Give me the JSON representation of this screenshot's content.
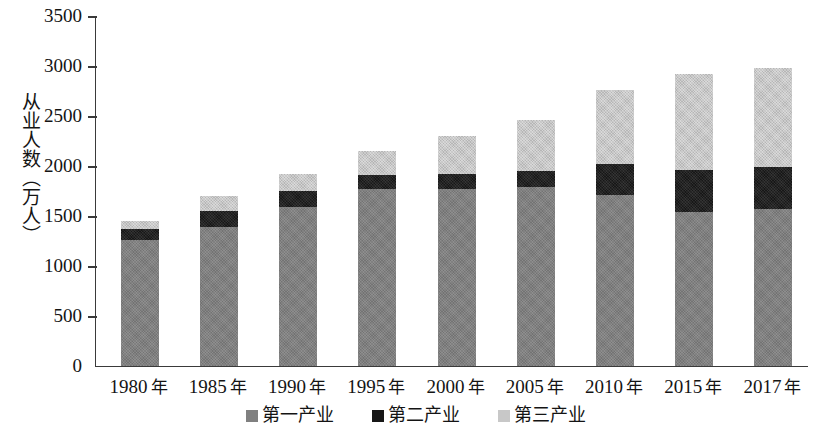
{
  "chart_data": {
    "type": "bar",
    "subtype": "stacked-bar",
    "title": "",
    "xlabel": "",
    "ylabel": "从业人数（万人）",
    "ylim": [
      0,
      3500
    ],
    "ytick_step": 500,
    "yticks": [
      "3500",
      "3000",
      "2500",
      "2000",
      "1500",
      "1000",
      "500",
      "0"
    ],
    "grid": false,
    "legend_position": "bottom-center",
    "categories": [
      "1980 年",
      "1985 年",
      "1990 年",
      "1995 年",
      "2000 年",
      "2005 年",
      "2010 年",
      "2015 年",
      "2017 年"
    ],
    "category_years": [
      "1980",
      "1985",
      "1990",
      "1995",
      "2000",
      "2005",
      "2010",
      "2015",
      "2017"
    ],
    "category_unit": "年",
    "series": [
      {
        "name": "第一产业",
        "color": "#808080",
        "values": [
          1260,
          1390,
          1590,
          1770,
          1770,
          1790,
          1710,
          1540,
          1570
        ]
      },
      {
        "name": "第二产业",
        "color": "#171717",
        "values": [
          110,
          160,
          160,
          140,
          150,
          160,
          310,
          420,
          420
        ]
      },
      {
        "name": "第三产业",
        "color": "#c8c8c8",
        "values": [
          80,
          150,
          170,
          240,
          380,
          510,
          740,
          960,
          990
        ]
      }
    ],
    "totals": [
      1450,
      1700,
      1920,
      2150,
      2300,
      2460,
      2760,
      2920,
      2980
    ]
  },
  "legend": {
    "items": [
      {
        "label": "第一产业",
        "swatch": "legend-swatch-primary"
      },
      {
        "label": "第二产业",
        "swatch": "legend-swatch-secondary"
      },
      {
        "label": "第三产业",
        "swatch": "legend-swatch-tertiary"
      }
    ]
  }
}
